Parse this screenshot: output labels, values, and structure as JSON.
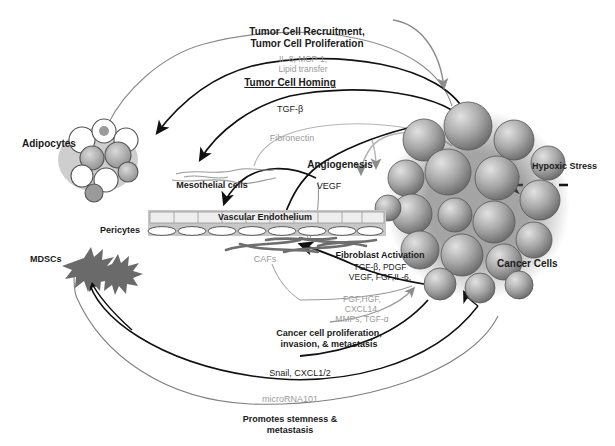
{
  "figure": {
    "colors": {
      "dark_text": "#1a1a1a",
      "gray_text": "#9a9a9a",
      "dark_arrow": "#111111",
      "gray_arrow": "#8c8c8c",
      "cell_fill": "#b3b3b3",
      "background": "#ffffff"
    }
  },
  "cell_labels": {
    "adipocytes": "Adipocytes",
    "mesothelial": "Mesothelial cells",
    "vascular_endothelium": "Vascular Endothelium",
    "pericytes": "Pericytes",
    "mdscs": "MDSCs",
    "cafs": "CAFs",
    "cancer_cells": "Cancer Cells"
  },
  "process_labels": {
    "tumor_recruitment_line1": "Tumor Cell Recruitment,",
    "tumor_recruitment_line2": "Tumor Cell Proliferation",
    "tumor_cell_homing": "Tumor Cell Homing",
    "angiogenesis": "Angiogenesis",
    "fibroblast_activation": "Fibroblast Activation",
    "cancer_proliferation_line1": "Cancer cell proliferation,",
    "cancer_proliferation_line2": "invasion, & metastasis",
    "promotes_stemness_line1": "Promotes stemness &",
    "promotes_stemness_line2": "metastasis",
    "hypoxic_stress": "Hypoxic Stress"
  },
  "mediators": {
    "il8_mcp1_line1": "IL-8, MCP-1,",
    "il8_mcp1_line2": "Lipid transfer",
    "tgf_beta": "TGF-β",
    "fibronectin": "Fibronectin",
    "vegf": "VEGF",
    "fibroblast_factors_line1": "TGF-β,  PDGF",
    "fibroblast_factors_line2": "VEGF, FGF,IL-6,",
    "caf_factors_line1": "FGF,HGF,",
    "caf_factors_line2": "CXCL14,",
    "caf_factors_line3": "MMPs, TGF-α",
    "snail_cxcl": "Snail, CXCL1/2",
    "microrna": "microRNA101"
  }
}
